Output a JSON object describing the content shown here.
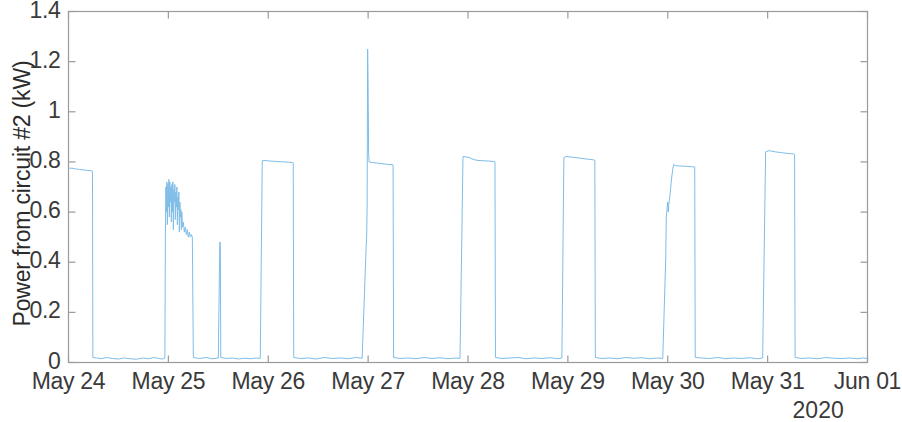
{
  "chart_data": {
    "type": "line",
    "title": "",
    "xlabel": "2020",
    "ylabel": "Power from circuit #2 (kW)",
    "ylim": [
      0,
      1.4
    ],
    "yticks": [
      0,
      0.2,
      0.4,
      0.6,
      0.8,
      1,
      1.2,
      1.4
    ],
    "ytick_labels": [
      "0",
      "0.2",
      "0.4",
      "0.6",
      "0.8",
      "1",
      "1.2",
      "1.4"
    ],
    "xlim": [
      "May 24",
      "Jun 01"
    ],
    "xtick_labels": [
      "May 24",
      "May 25",
      "May 26",
      "May 27",
      "May 28",
      "May 29",
      "May 30",
      "May 31",
      "Jun 01"
    ],
    "xtick_days": [
      0,
      1,
      2,
      3,
      4,
      5,
      6,
      7,
      8
    ],
    "grid": false,
    "legend": null,
    "line_color": "#7fbde8",
    "line_width": 1,
    "axis_color": "#9a9a9a",
    "background": "#ffffff",
    "series": [
      {
        "name": "Power from circuit #2",
        "unit": "kW",
        "baseline_kw": 0.012,
        "peak_kw": 1.25,
        "description": "Square-wave daily load pulses on a near-zero baseline, one pulse per day",
        "points": [
          [
            0.0,
            0.775
          ],
          [
            0.035,
            0.775
          ],
          [
            0.07,
            0.772
          ],
          [
            0.11,
            0.77
          ],
          [
            0.15,
            0.768
          ],
          [
            0.19,
            0.766
          ],
          [
            0.225,
            0.765
          ],
          [
            0.24,
            0.763
          ],
          [
            0.244,
            0.02
          ],
          [
            0.28,
            0.018
          ],
          [
            0.33,
            0.015
          ],
          [
            0.38,
            0.02
          ],
          [
            0.44,
            0.016
          ],
          [
            0.5,
            0.014
          ],
          [
            0.56,
            0.018
          ],
          [
            0.62,
            0.015
          ],
          [
            0.68,
            0.013
          ],
          [
            0.74,
            0.018
          ],
          [
            0.8,
            0.015
          ],
          [
            0.86,
            0.02
          ],
          [
            0.9,
            0.016
          ],
          [
            0.94,
            0.014
          ],
          [
            0.965,
            0.018
          ],
          [
            0.97,
            0.5
          ],
          [
            0.975,
            0.7
          ],
          [
            0.98,
            0.6
          ],
          [
            0.985,
            0.72
          ],
          [
            0.99,
            0.55
          ],
          [
            0.995,
            0.71
          ],
          [
            1.0,
            0.62
          ],
          [
            1.005,
            0.73
          ],
          [
            1.01,
            0.58
          ],
          [
            1.015,
            0.72
          ],
          [
            1.02,
            0.64
          ],
          [
            1.025,
            0.7
          ],
          [
            1.03,
            0.56
          ],
          [
            1.035,
            0.71
          ],
          [
            1.04,
            0.6
          ],
          [
            1.045,
            0.72
          ],
          [
            1.05,
            0.53
          ],
          [
            1.055,
            0.69
          ],
          [
            1.06,
            0.64
          ],
          [
            1.065,
            0.71
          ],
          [
            1.07,
            0.57
          ],
          [
            1.075,
            0.68
          ],
          [
            1.08,
            0.62
          ],
          [
            1.085,
            0.7
          ],
          [
            1.09,
            0.55
          ],
          [
            1.095,
            0.66
          ],
          [
            1.1,
            0.61
          ],
          [
            1.105,
            0.68
          ],
          [
            1.11,
            0.52
          ],
          [
            1.115,
            0.64
          ],
          [
            1.12,
            0.58
          ],
          [
            1.125,
            0.61
          ],
          [
            1.13,
            0.53
          ],
          [
            1.135,
            0.6
          ],
          [
            1.14,
            0.54
          ],
          [
            1.15,
            0.56
          ],
          [
            1.16,
            0.52
          ],
          [
            1.17,
            0.54
          ],
          [
            1.18,
            0.51
          ],
          [
            1.19,
            0.53
          ],
          [
            1.2,
            0.5
          ],
          [
            1.21,
            0.52
          ],
          [
            1.22,
            0.5
          ],
          [
            1.23,
            0.51
          ],
          [
            1.24,
            0.5
          ],
          [
            1.25,
            0.02
          ],
          [
            1.31,
            0.016
          ],
          [
            1.38,
            0.02
          ],
          [
            1.44,
            0.015
          ],
          [
            1.5,
            0.018
          ],
          [
            1.515,
            0.48
          ],
          [
            1.52,
            0.48
          ],
          [
            1.525,
            0.02
          ],
          [
            1.58,
            0.016
          ],
          [
            1.64,
            0.018
          ],
          [
            1.7,
            0.014
          ],
          [
            1.76,
            0.017
          ],
          [
            1.82,
            0.015
          ],
          [
            1.88,
            0.018
          ],
          [
            1.92,
            0.016
          ],
          [
            1.94,
            0.805
          ],
          [
            1.97,
            0.806
          ],
          [
            2.0,
            0.804
          ],
          [
            2.04,
            0.803
          ],
          [
            2.08,
            0.802
          ],
          [
            2.12,
            0.801
          ],
          [
            2.16,
            0.8
          ],
          [
            2.2,
            0.799
          ],
          [
            2.24,
            0.798
          ],
          [
            2.25,
            0.797
          ],
          [
            2.255,
            0.02
          ],
          [
            2.32,
            0.016
          ],
          [
            2.4,
            0.018
          ],
          [
            2.48,
            0.014
          ],
          [
            2.56,
            0.02
          ],
          [
            2.64,
            0.016
          ],
          [
            2.72,
            0.018
          ],
          [
            2.8,
            0.015
          ],
          [
            2.88,
            0.02
          ],
          [
            2.94,
            0.017
          ],
          [
            2.98,
            0.46
          ],
          [
            2.985,
            0.5
          ],
          [
            2.99,
            0.62
          ],
          [
            2.995,
            1.25
          ],
          [
            3.0,
            1.1
          ],
          [
            3.005,
            0.83
          ],
          [
            3.01,
            0.8
          ],
          [
            3.04,
            0.798
          ],
          [
            3.08,
            0.796
          ],
          [
            3.12,
            0.794
          ],
          [
            3.16,
            0.792
          ],
          [
            3.2,
            0.79
          ],
          [
            3.24,
            0.789
          ],
          [
            3.25,
            0.788
          ],
          [
            3.255,
            0.02
          ],
          [
            3.32,
            0.016
          ],
          [
            3.4,
            0.018
          ],
          [
            3.48,
            0.015
          ],
          [
            3.56,
            0.02
          ],
          [
            3.64,
            0.016
          ],
          [
            3.72,
            0.019
          ],
          [
            3.8,
            0.015
          ],
          [
            3.88,
            0.018
          ],
          [
            3.92,
            0.016
          ],
          [
            3.95,
            0.822
          ],
          [
            3.98,
            0.82
          ],
          [
            4.01,
            0.818
          ],
          [
            4.04,
            0.812
          ],
          [
            4.07,
            0.808
          ],
          [
            4.1,
            0.806
          ],
          [
            4.14,
            0.805
          ],
          [
            4.18,
            0.804
          ],
          [
            4.22,
            0.803
          ],
          [
            4.26,
            0.802
          ],
          [
            4.27,
            0.8
          ],
          [
            4.275,
            0.02
          ],
          [
            4.34,
            0.016
          ],
          [
            4.42,
            0.018
          ],
          [
            4.5,
            0.02
          ],
          [
            4.58,
            0.015
          ],
          [
            4.66,
            0.018
          ],
          [
            4.74,
            0.016
          ],
          [
            4.82,
            0.019
          ],
          [
            4.9,
            0.015
          ],
          [
            4.94,
            0.018
          ],
          [
            4.96,
            0.818
          ],
          [
            4.99,
            0.822
          ],
          [
            5.02,
            0.82
          ],
          [
            5.06,
            0.818
          ],
          [
            5.1,
            0.816
          ],
          [
            5.14,
            0.814
          ],
          [
            5.18,
            0.812
          ],
          [
            5.22,
            0.81
          ],
          [
            5.26,
            0.808
          ],
          [
            5.27,
            0.806
          ],
          [
            5.275,
            0.02
          ],
          [
            5.34,
            0.016
          ],
          [
            5.42,
            0.018
          ],
          [
            5.5,
            0.015
          ],
          [
            5.58,
            0.02
          ],
          [
            5.66,
            0.017
          ],
          [
            5.74,
            0.019
          ],
          [
            5.82,
            0.015
          ],
          [
            5.9,
            0.018
          ],
          [
            5.95,
            0.016
          ],
          [
            5.98,
            0.42
          ],
          [
            5.985,
            0.58
          ],
          [
            5.99,
            0.6
          ],
          [
            5.995,
            0.62
          ],
          [
            6.0,
            0.64
          ],
          [
            6.005,
            0.6
          ],
          [
            6.01,
            0.63
          ],
          [
            6.02,
            0.66
          ],
          [
            6.03,
            0.7
          ],
          [
            6.04,
            0.74
          ],
          [
            6.05,
            0.77
          ],
          [
            6.06,
            0.79
          ],
          [
            6.08,
            0.785
          ],
          [
            6.12,
            0.784
          ],
          [
            6.16,
            0.783
          ],
          [
            6.2,
            0.782
          ],
          [
            6.24,
            0.781
          ],
          [
            6.27,
            0.78
          ],
          [
            6.275,
            0.02
          ],
          [
            6.34,
            0.018
          ],
          [
            6.42,
            0.016
          ],
          [
            6.5,
            0.02
          ],
          [
            6.58,
            0.015
          ],
          [
            6.66,
            0.018
          ],
          [
            6.74,
            0.016
          ],
          [
            6.82,
            0.019
          ],
          [
            6.9,
            0.015
          ],
          [
            6.95,
            0.018
          ],
          [
            6.98,
            0.84
          ],
          [
            7.01,
            0.845
          ],
          [
            7.04,
            0.843
          ],
          [
            7.08,
            0.84
          ],
          [
            7.12,
            0.838
          ],
          [
            7.16,
            0.836
          ],
          [
            7.2,
            0.834
          ],
          [
            7.24,
            0.833
          ],
          [
            7.26,
            0.832
          ],
          [
            7.27,
            0.83
          ],
          [
            7.275,
            0.02
          ],
          [
            7.34,
            0.016
          ],
          [
            7.42,
            0.018
          ],
          [
            7.5,
            0.015
          ],
          [
            7.58,
            0.02
          ],
          [
            7.66,
            0.017
          ],
          [
            7.74,
            0.016
          ],
          [
            7.82,
            0.018
          ],
          [
            7.9,
            0.015
          ],
          [
            7.96,
            0.018
          ],
          [
            8.0,
            0.016
          ]
        ]
      }
    ]
  },
  "axes": {
    "ylabel_text": "Power from circuit #2 (kW)",
    "year_text": "2020"
  }
}
